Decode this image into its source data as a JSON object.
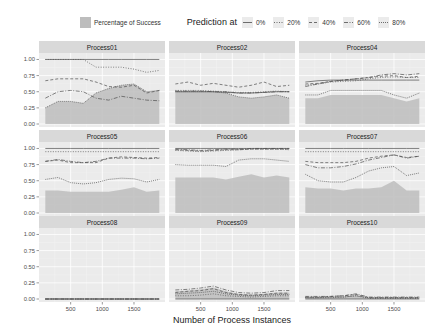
{
  "chart_data": {
    "type": "area",
    "title": "",
    "xlabel": "Number of Process Instances",
    "ylabel": "",
    "xlim": [
      0,
      1990
    ],
    "ylim": [
      0,
      1.1
    ],
    "x_ticks": [
      500,
      1000,
      1500
    ],
    "y_ticks": [
      0.0,
      0.25,
      0.5,
      0.75,
      1.0
    ],
    "y_tick_labels": [
      "0.00",
      "0.25",
      "0.50",
      "0.75",
      "1.00"
    ],
    "grid": true,
    "legend": {
      "position": "top",
      "fill_label": "Percentage of Success",
      "lines_title": "Prediction at",
      "lines": [
        {
          "label": "0%",
          "dash": ""
        },
        {
          "label": "20%",
          "dash": "1,1.5"
        },
        {
          "label": "40%",
          "dash": "3,2"
        },
        {
          "label": "60%",
          "dash": "4,1.5,1,1.5"
        },
        {
          "label": "80%",
          "dash": "1,1"
        }
      ]
    },
    "x": [
      100,
      300,
      500,
      700,
      900,
      1100,
      1300,
      1500,
      1700,
      1900
    ],
    "panels": [
      {
        "name": "Process01",
        "success": [
          0.25,
          0.35,
          0.35,
          0.32,
          0.48,
          0.55,
          0.6,
          0.62,
          0.5,
          0.52
        ],
        "series": [
          [
            1.0,
            1.0,
            1.0,
            1.0,
            1.0,
            1.0,
            1.0,
            1.0,
            1.0,
            1.0
          ],
          [
            1.0,
            1.0,
            1.0,
            1.0,
            0.88,
            0.88,
            0.88,
            0.85,
            0.8,
            0.83
          ],
          [
            0.67,
            0.7,
            0.7,
            0.7,
            0.65,
            0.58,
            0.57,
            0.6,
            0.48,
            0.52
          ],
          [
            0.4,
            0.5,
            0.52,
            0.5,
            0.4,
            0.37,
            0.43,
            0.4,
            0.37,
            0.36
          ],
          [
            0.25,
            0.35,
            0.35,
            0.32,
            0.48,
            0.55,
            0.6,
            0.62,
            0.5,
            0.52
          ]
        ]
      },
      {
        "name": "Process02",
        "success": [
          0.5,
          0.5,
          0.5,
          0.5,
          0.48,
          0.42,
          0.4,
          0.42,
          0.45,
          0.4
        ],
        "series": [
          [
            0.5,
            0.5,
            0.5,
            0.5,
            0.49,
            0.48,
            0.48,
            0.49,
            0.5,
            0.5
          ],
          [
            0.52,
            0.52,
            0.52,
            0.51,
            0.5,
            0.49,
            0.49,
            0.5,
            0.51,
            0.5
          ],
          [
            0.62,
            0.65,
            0.6,
            0.63,
            0.6,
            0.57,
            0.6,
            0.65,
            0.58,
            0.6
          ],
          [
            0.51,
            0.51,
            0.51,
            0.5,
            0.5,
            0.48,
            0.48,
            0.49,
            0.5,
            0.5
          ],
          [
            0.5,
            0.5,
            0.5,
            0.5,
            0.48,
            0.42,
            0.4,
            0.42,
            0.45,
            0.4
          ]
        ]
      },
      {
        "name": "Process04",
        "success": [
          0.4,
          0.4,
          0.45,
          0.45,
          0.45,
          0.45,
          0.45,
          0.4,
          0.35,
          0.4
        ],
        "series": [
          [
            0.65,
            0.67,
            0.68,
            0.68,
            0.68,
            0.68,
            0.68,
            0.68,
            0.68,
            0.68
          ],
          [
            0.6,
            0.62,
            0.65,
            0.66,
            0.67,
            0.7,
            0.72,
            0.73,
            0.72,
            0.72
          ],
          [
            0.62,
            0.63,
            0.66,
            0.68,
            0.7,
            0.72,
            0.74,
            0.75,
            0.72,
            0.74
          ],
          [
            0.58,
            0.62,
            0.66,
            0.68,
            0.7,
            0.72,
            0.76,
            0.78,
            0.76,
            0.78
          ],
          [
            0.45,
            0.45,
            0.52,
            0.52,
            0.52,
            0.52,
            0.52,
            0.45,
            0.4,
            0.48
          ]
        ]
      },
      {
        "name": "Process05",
        "success": [
          0.35,
          0.35,
          0.33,
          0.33,
          0.33,
          0.33,
          0.36,
          0.4,
          0.33,
          0.35
        ],
        "series": [
          [
            1.0,
            1.0,
            1.0,
            1.0,
            1.0,
            1.0,
            1.0,
            1.0,
            1.0,
            1.0
          ],
          [
            0.95,
            0.95,
            0.95,
            0.95,
            0.95,
            0.95,
            0.95,
            0.95,
            0.95,
            0.95
          ],
          [
            0.8,
            0.82,
            0.78,
            0.78,
            0.78,
            0.85,
            0.87,
            0.86,
            0.85,
            0.86
          ],
          [
            0.8,
            0.83,
            0.8,
            0.78,
            0.8,
            0.85,
            0.85,
            0.85,
            0.84,
            0.85
          ],
          [
            0.52,
            0.55,
            0.47,
            0.45,
            0.47,
            0.52,
            0.54,
            0.53,
            0.48,
            0.52
          ]
        ]
      },
      {
        "name": "Process06",
        "success": [
          0.55,
          0.55,
          0.55,
          0.55,
          0.52,
          0.56,
          0.6,
          0.55,
          0.58,
          0.55
        ],
        "series": [
          [
            1.0,
            1.0,
            1.0,
            1.0,
            1.0,
            1.0,
            1.0,
            1.0,
            1.0,
            1.0
          ],
          [
            0.97,
            0.96,
            0.95,
            0.96,
            0.97,
            0.98,
            0.99,
            0.99,
            0.99,
            0.98
          ],
          [
            0.98,
            0.97,
            0.96,
            0.97,
            0.98,
            0.98,
            0.99,
            0.99,
            0.99,
            0.99
          ],
          [
            0.99,
            0.98,
            0.97,
            0.98,
            0.99,
            0.99,
            1.0,
            1.0,
            1.0,
            1.0
          ],
          [
            0.75,
            0.74,
            0.74,
            0.74,
            0.72,
            0.82,
            0.84,
            0.84,
            0.82,
            0.8
          ]
        ]
      },
      {
        "name": "Process07",
        "success": [
          0.4,
          0.38,
          0.38,
          0.35,
          0.38,
          0.38,
          0.4,
          0.5,
          0.35,
          0.35
        ],
        "series": [
          [
            1.0,
            1.0,
            1.0,
            1.0,
            1.0,
            1.0,
            1.0,
            1.0,
            1.0,
            1.0
          ],
          [
            0.95,
            0.95,
            0.95,
            0.95,
            0.95,
            0.95,
            0.95,
            0.95,
            0.95,
            0.95
          ],
          [
            0.8,
            0.78,
            0.78,
            0.78,
            0.8,
            0.85,
            0.88,
            0.9,
            0.86,
            0.88
          ],
          [
            0.75,
            0.7,
            0.7,
            0.72,
            0.76,
            0.82,
            0.86,
            0.9,
            0.85,
            0.88
          ],
          [
            0.6,
            0.5,
            0.48,
            0.48,
            0.55,
            0.65,
            0.7,
            0.72,
            0.58,
            0.62
          ]
        ]
      },
      {
        "name": "Process08",
        "success": [
          0.0,
          0.0,
          0.0,
          0.0,
          0.0,
          0.0,
          0.0,
          0.0,
          0.0,
          0.0
        ],
        "series": [
          [
            0.0,
            0.0,
            0.0,
            0.0,
            0.0,
            0.0,
            0.0,
            0.0,
            0.0,
            0.0
          ],
          [
            0.0,
            0.0,
            0.0,
            0.0,
            0.0,
            0.0,
            0.0,
            0.0,
            0.0,
            0.0
          ],
          [
            0.0,
            0.0,
            0.0,
            0.0,
            0.0,
            0.0,
            0.0,
            0.0,
            0.0,
            0.0
          ],
          [
            0.0,
            0.0,
            0.0,
            0.0,
            0.0,
            0.0,
            0.0,
            0.0,
            0.0,
            0.0
          ],
          [
            0.0,
            0.0,
            0.0,
            0.0,
            0.0,
            0.0,
            0.0,
            0.0,
            0.0,
            0.0
          ]
        ]
      },
      {
        "name": "Process09",
        "success": [
          0.12,
          0.13,
          0.15,
          0.18,
          0.12,
          0.08,
          0.07,
          0.08,
          0.1,
          0.1
        ],
        "series": [
          [
            0.0,
            0.0,
            0.0,
            0.0,
            0.0,
            0.0,
            0.0,
            0.0,
            0.0,
            0.0
          ],
          [
            0.05,
            0.05,
            0.06,
            0.08,
            0.05,
            0.04,
            0.03,
            0.04,
            0.05,
            0.05
          ],
          [
            0.1,
            0.12,
            0.13,
            0.16,
            0.1,
            0.07,
            0.06,
            0.07,
            0.09,
            0.09
          ],
          [
            0.14,
            0.15,
            0.17,
            0.2,
            0.14,
            0.1,
            0.09,
            0.1,
            0.13,
            0.13
          ],
          [
            0.08,
            0.09,
            0.1,
            0.12,
            0.08,
            0.06,
            0.05,
            0.06,
            0.07,
            0.07
          ]
        ]
      },
      {
        "name": "Process10",
        "success": [
          0.03,
          0.03,
          0.03,
          0.04,
          0.06,
          0.02,
          0.02,
          0.02,
          0.02,
          0.02
        ],
        "series": [
          [
            0.0,
            0.0,
            0.0,
            0.0,
            0.0,
            0.0,
            0.0,
            0.0,
            0.0,
            0.0
          ],
          [
            0.02,
            0.02,
            0.02,
            0.03,
            0.05,
            0.01,
            0.01,
            0.01,
            0.01,
            0.01
          ],
          [
            0.03,
            0.03,
            0.04,
            0.05,
            0.07,
            0.02,
            0.02,
            0.02,
            0.02,
            0.02
          ],
          [
            0.04,
            0.04,
            0.04,
            0.05,
            0.08,
            0.03,
            0.03,
            0.03,
            0.03,
            0.03
          ],
          [
            0.02,
            0.02,
            0.03,
            0.03,
            0.05,
            0.02,
            0.02,
            0.02,
            0.02,
            0.02
          ]
        ]
      }
    ]
  },
  "colors": {
    "panel_bg": "#ebebeb",
    "strip_bg": "#d9d9d9",
    "grid": "#ffffff",
    "fill": "#bdbdbd",
    "line": "#4d4d4d",
    "text": "#4d4d4d"
  }
}
